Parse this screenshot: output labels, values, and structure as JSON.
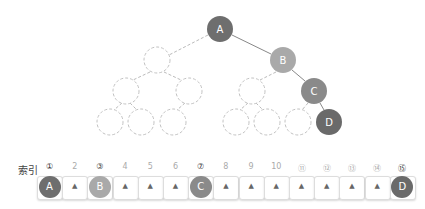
{
  "tree": {
    "nodes": [
      {
        "id": "A",
        "label": "A",
        "cx": 220,
        "cy": 29,
        "filled": true,
        "color": "#6e6e6e"
      },
      {
        "id": "B",
        "label": "B",
        "cx": 283,
        "cy": 60,
        "filled": true,
        "color": "#a9a9a9"
      },
      {
        "id": "C",
        "label": "C",
        "cx": 314,
        "cy": 91,
        "filled": true,
        "color": "#8a8a8a"
      },
      {
        "id": "D",
        "label": "D",
        "cx": 329,
        "cy": 122,
        "filled": true,
        "color": "#6a6a6a"
      },
      {
        "id": "L1",
        "label": "",
        "cx": 157,
        "cy": 60,
        "filled": false
      },
      {
        "id": "L2a",
        "label": "",
        "cx": 126,
        "cy": 91,
        "filled": false
      },
      {
        "id": "L2b",
        "label": "",
        "cx": 189,
        "cy": 91,
        "filled": false
      },
      {
        "id": "L3a",
        "label": "",
        "cx": 110,
        "cy": 122,
        "filled": false
      },
      {
        "id": "L3b",
        "label": "",
        "cx": 141,
        "cy": 122,
        "filled": false
      },
      {
        "id": "L3c",
        "label": "",
        "cx": 173,
        "cy": 122,
        "filled": false
      },
      {
        "id": "R2",
        "label": "",
        "cx": 252,
        "cy": 91,
        "filled": false
      },
      {
        "id": "R3a",
        "label": "",
        "cx": 236,
        "cy": 122,
        "filled": false
      },
      {
        "id": "R3b",
        "label": "",
        "cx": 267,
        "cy": 122,
        "filled": false
      },
      {
        "id": "R3c",
        "label": "",
        "cx": 298,
        "cy": 122,
        "filled": false
      }
    ]
  },
  "array": {
    "title": "索引",
    "cells": [
      {
        "index": "①",
        "active": true,
        "value": "A",
        "color": "#6e6e6e"
      },
      {
        "index": "2",
        "active": false,
        "value": "▲"
      },
      {
        "index": "③",
        "active": true,
        "value": "B",
        "color": "#a9a9a9"
      },
      {
        "index": "4",
        "active": false,
        "value": "▲"
      },
      {
        "index": "5",
        "active": false,
        "value": "▲"
      },
      {
        "index": "6",
        "active": false,
        "value": "▲"
      },
      {
        "index": "⑦",
        "active": true,
        "value": "C",
        "color": "#8a8a8a"
      },
      {
        "index": "8",
        "active": false,
        "value": "▲"
      },
      {
        "index": "9",
        "active": false,
        "value": "▲"
      },
      {
        "index": "10",
        "active": false,
        "value": "▲"
      },
      {
        "index": "⑪",
        "active": false,
        "value": "▲"
      },
      {
        "index": "⑫",
        "active": false,
        "value": "▲"
      },
      {
        "index": "⑬",
        "active": false,
        "value": "▲"
      },
      {
        "index": "⑭",
        "active": false,
        "value": "▲"
      },
      {
        "index": "⑮",
        "active": true,
        "value": "D",
        "color": "#6a6a6a"
      }
    ]
  }
}
